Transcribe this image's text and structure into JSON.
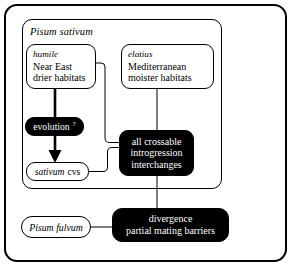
{
  "figure": {
    "panel": {
      "title": "Pisum sativum",
      "title_style": "italic"
    },
    "nodes": {
      "humile": {
        "name": "humile",
        "line2": "Near East",
        "line3": "drier habitats",
        "style": "white"
      },
      "elatius": {
        "name": "elatius",
        "line2": "Mediterranean",
        "line3": "moister habitats",
        "style": "white"
      },
      "evolution": {
        "label": "evolution",
        "marker": "?",
        "style": "black"
      },
      "sativum_cvs": {
        "name": "sativum",
        "suffix": "cvs",
        "style": "white"
      },
      "crossable": {
        "line1": "all crossable",
        "line2": "introgression",
        "line3": "interchanges",
        "style": "black"
      },
      "fulvum": {
        "name": "Pisum fulvum",
        "style": "white"
      },
      "divergence": {
        "line1": "divergence",
        "line2": "partial mating barriers",
        "style": "black"
      }
    },
    "colors": {
      "ink": "#000000",
      "paper": "#ffffff",
      "node_fill_black": "#000000",
      "node_text_on_black": "#ffffff"
    }
  }
}
